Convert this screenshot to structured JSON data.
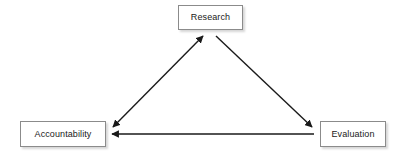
{
  "diagram": {
    "title": "",
    "background_color": "#ffffff",
    "nodes": [
      {
        "id": "research",
        "label": "Research"
      },
      {
        "id": "accountability",
        "label": "Accountability"
      },
      {
        "id": "evaluation",
        "label": "Evaluation"
      }
    ],
    "connectors": [
      {
        "id": "accountability-research",
        "from": "accountability",
        "to": "research",
        "direction": "bidirectional",
        "style": "solid"
      },
      {
        "id": "research-evaluation",
        "from": "research",
        "to": "evaluation",
        "direction": "forward",
        "style": "solid"
      },
      {
        "id": "evaluation-accountability",
        "from": "evaluation",
        "to": "accountability",
        "direction": "forward",
        "style": "solid"
      }
    ],
    "colors": {
      "line": "#1a1a1a",
      "box_border": "#8b8b8b",
      "box_fill": "#ffffff",
      "text": "#1a1a1a",
      "shadow": "rgba(0,0,0,0.16)"
    }
  }
}
